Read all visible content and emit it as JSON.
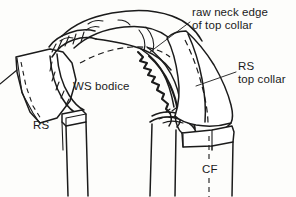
{
  "figure": {
    "style": "black line drawing on white background",
    "background_color": "#fdfdfb",
    "ink_color": "#1b1b1b",
    "canvas": {
      "width": 296,
      "height": 197
    }
  },
  "labels": {
    "raw_neck_edge": {
      "line1": "raw neck edge",
      "line2": "of top collar",
      "text": "raw neck edge\nof top collar",
      "points_to": "serrated-raw-edge"
    },
    "rs_top_collar": {
      "line1": "RS",
      "line2": "top collar",
      "text": "RS\ntop collar",
      "points_to": "right-collar-flap"
    },
    "ws_bodice": {
      "text": "WS bodice",
      "points_to": "bodice-wrong-side"
    },
    "rs_left": {
      "text": "RS",
      "points_to": "left-under-collar-flap"
    },
    "cf": {
      "text": "CF",
      "meaning_hint": "centre front marking",
      "points_to": "centre-front-dashed-line"
    }
  },
  "drawing_parts": [
    {
      "name": "left-collar-flap",
      "description": "fabric flap folded out at left with stitching line"
    },
    {
      "name": "collar-band-top",
      "description": "long curved collar band across the top"
    },
    {
      "name": "serrated-raw-edge",
      "description": "zigzag pinked raw neck edge of top collar"
    },
    {
      "name": "right-collar-flap",
      "description": "large collar panel folded to the right showing right side"
    },
    {
      "name": "left-bodice-front",
      "description": "left bodice front strip with folded facing"
    },
    {
      "name": "right-bodice-front",
      "description": "right bodice front strip with folded facing"
    },
    {
      "name": "centre-front-dashed-line",
      "description": "vertical dashed line marking centre front"
    }
  ]
}
